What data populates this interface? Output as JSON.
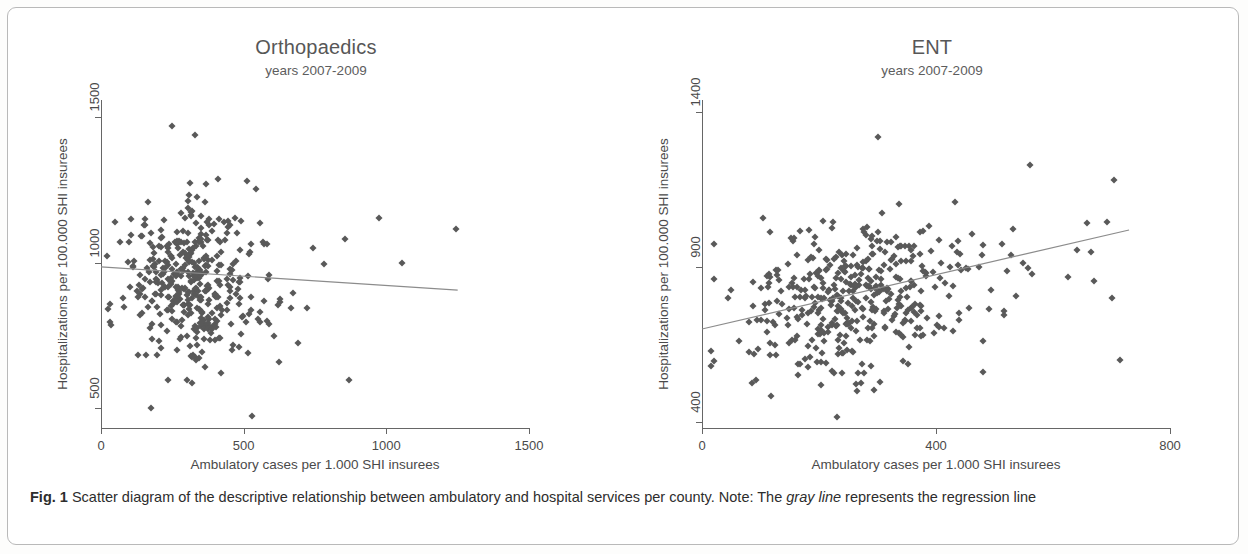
{
  "figure": {
    "caption_label": "Fig. 1",
    "caption_part1": " Scatter diagram of the descriptive relationship between ambulatory and hospital services per county. Note: The ",
    "caption_emphasis": "gray line",
    "caption_part2": " represents the regression line",
    "marker_color": "#595959",
    "axis_color": "#666666",
    "regression_line_color": "#8c8c8c",
    "frame_color": "#b9b9b9"
  },
  "chart_data": [
    {
      "type": "scatter",
      "title": "Orthopaedics",
      "subtitle": "years 2007-2009",
      "xlabel": "Ambulatory cases per 1.000 SHI insurees",
      "ylabel": "Hospitalizations per 100.000 SHI insurees",
      "xlim": [
        0,
        1500
      ],
      "ylim": [
        430,
        1560
      ],
      "xticks": [
        0,
        500,
        1000,
        1500
      ],
      "yticks": [
        500,
        1000,
        1500
      ],
      "grid": false,
      "legend": "none",
      "n_points": 412,
      "cloud": {
        "x_center": 300,
        "x_spread": 105,
        "y_center": 930,
        "y_spread": 135,
        "correlation": -0.05,
        "x_min": 20,
        "x_max": 1250,
        "y_min": 470,
        "y_max": 1480,
        "tail_fraction": 0.17,
        "tail_x_max": 1250,
        "seed": 20072009
      },
      "regression": {
        "x0": 0,
        "y0": 985,
        "x1": 1250,
        "y1": 905,
        "slope_sign": "negative"
      },
      "outliers": [
        {
          "x": 30,
          "y": 795
        },
        {
          "x": 975,
          "y": 1155
        },
        {
          "x": 1245,
          "y": 1115
        },
        {
          "x": 1055,
          "y": 1000
        },
        {
          "x": 855,
          "y": 1080
        },
        {
          "x": 870,
          "y": 595
        },
        {
          "x": 175,
          "y": 500
        },
        {
          "x": 250,
          "y": 1470
        },
        {
          "x": 330,
          "y": 1440
        }
      ]
    },
    {
      "type": "scatter",
      "title": "ENT",
      "subtitle": "years 2007-2009",
      "xlabel": "Ambulatory cases per 1.000 SHI insurees",
      "ylabel": "Hospitalizations per 100.000 SHI insurees",
      "xlim": [
        0,
        800
      ],
      "ylim": [
        380,
        1440
      ],
      "xticks": [
        0,
        400,
        800
      ],
      "yticks": [
        400,
        900,
        1400
      ],
      "grid": false,
      "legend": "none",
      "n_points": 430,
      "cloud": {
        "x_center": 235,
        "x_spread": 88,
        "y_center": 790,
        "y_spread": 125,
        "correlation": 0.3,
        "x_min": 15,
        "x_max": 720,
        "y_min": 420,
        "y_max": 1350,
        "tail_fraction": 0.2,
        "tail_x_max": 720,
        "seed": 31415926
      },
      "regression": {
        "x0": 0,
        "y0": 700,
        "x1": 730,
        "y1": 1020,
        "slope_sign": "positive"
      },
      "outliers": [
        {
          "x": 20,
          "y": 860
        },
        {
          "x": 705,
          "y": 1180
        },
        {
          "x": 700,
          "y": 800
        },
        {
          "x": 715,
          "y": 600
        },
        {
          "x": 230,
          "y": 415
        },
        {
          "x": 300,
          "y": 1320
        },
        {
          "x": 560,
          "y": 1230
        },
        {
          "x": 480,
          "y": 560
        },
        {
          "x": 105,
          "y": 1060
        }
      ]
    }
  ]
}
